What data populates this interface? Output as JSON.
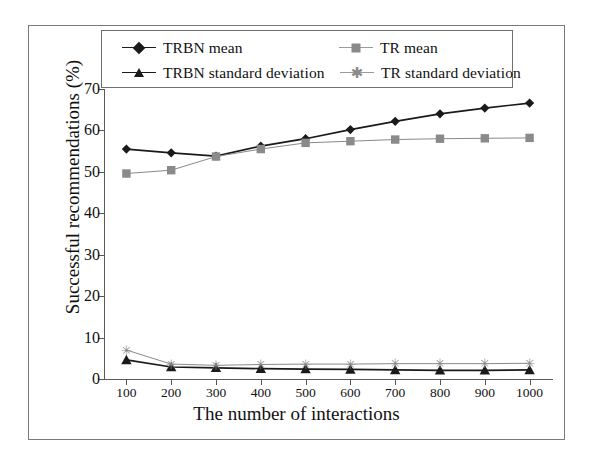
{
  "chart_data": {
    "type": "line",
    "title": "",
    "xlabel": "The number of interactions",
    "ylabel": "Successful recommendations (%)",
    "x": [
      100,
      200,
      300,
      400,
      500,
      600,
      700,
      800,
      900,
      1000
    ],
    "xticklabels": [
      "100",
      "200",
      "300",
      "400",
      "500",
      "600",
      "700",
      "800",
      "900",
      "1000"
    ],
    "yticklabels": [
      "0",
      "10",
      "20",
      "30",
      "40",
      "50",
      "60",
      "70"
    ],
    "yticks": [
      0,
      10,
      20,
      30,
      40,
      50,
      60,
      70
    ],
    "xlim": [
      50,
      1050
    ],
    "ylim": [
      0,
      70
    ],
    "grid": false,
    "legend_position": "top-inside",
    "series": [
      {
        "name": "TRBN mean",
        "marker": "diamond",
        "color": "#1a1a1a",
        "values": [
          55.5,
          54.6,
          53.8,
          56.2,
          58.0,
          60.2,
          62.2,
          64.0,
          65.4,
          66.6
        ]
      },
      {
        "name": "TR mean",
        "marker": "square",
        "color": "#8a8a8a",
        "values": [
          49.6,
          50.4,
          53.7,
          55.5,
          57.0,
          57.4,
          57.8,
          58.0,
          58.1,
          58.2
        ]
      },
      {
        "name": "TRBN standard deviation",
        "marker": "triangle",
        "color": "#1a1a1a",
        "values": [
          4.6,
          2.9,
          2.7,
          2.5,
          2.4,
          2.3,
          2.2,
          2.1,
          2.1,
          2.2
        ]
      },
      {
        "name": "TR standard deviation",
        "marker": "star",
        "color": "#8a8a8a",
        "values": [
          7.0,
          3.6,
          3.3,
          3.5,
          3.6,
          3.6,
          3.7,
          3.7,
          3.7,
          3.8
        ]
      }
    ]
  },
  "legend": {
    "entries": [
      {
        "label": "TRBN mean",
        "marker": "diamond-marker-icon"
      },
      {
        "label": "TR mean",
        "marker": "square-marker-icon"
      },
      {
        "label": "TRBN standard deviation",
        "marker": "triangle-marker-icon"
      },
      {
        "label": "TR standard deviation",
        "marker": "star-marker-icon"
      }
    ]
  },
  "colors": {
    "series_dark": "#1a1a1a",
    "series_gray": "#8a8a8a",
    "axis": "#5a5a5a",
    "frame": "#7a7a7a",
    "background": "#ffffff"
  }
}
